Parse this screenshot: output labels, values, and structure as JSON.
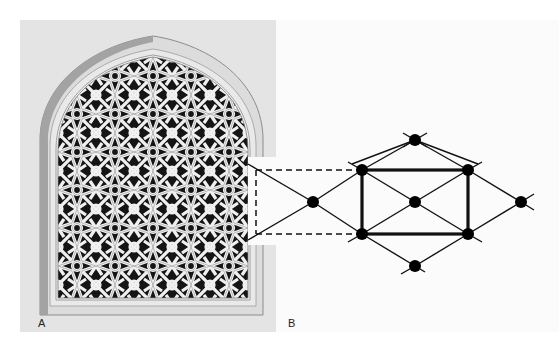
{
  "figure": {
    "panel_a": {
      "label": "A",
      "subject": "arched window with geometric star lattice (jali) screen",
      "colors": {
        "background": "#e4e4e4",
        "frame": "#d9d9d9",
        "frame_shadow": "#9a9a9a",
        "lattice_void": "#111111",
        "lattice_strap": "#f2f2f2"
      }
    },
    "panel_b": {
      "label": "B",
      "subject": "underlying grid of the lattice pattern",
      "nodes": [
        {
          "id": "left",
          "x": 313,
          "y": 202
        },
        {
          "id": "rect-top-left",
          "x": 362,
          "y": 170
        },
        {
          "id": "rect-bottom-left",
          "x": 362,
          "y": 234
        },
        {
          "id": "top",
          "x": 415,
          "y": 140
        },
        {
          "id": "center",
          "x": 415,
          "y": 202
        },
        {
          "id": "bottom",
          "x": 415,
          "y": 266
        },
        {
          "id": "rect-top-right",
          "x": 468,
          "y": 170
        },
        {
          "id": "rect-bottom-right",
          "x": 468,
          "y": 234
        },
        {
          "id": "right",
          "x": 521,
          "y": 202
        }
      ],
      "highlighted_rectangle": {
        "x1": 362,
        "y1": 170,
        "x2": 468,
        "y2": 234
      },
      "callout_box": {
        "x1": 256,
        "y1": 170,
        "x2": 362,
        "y2": 234
      },
      "colors": {
        "line": "#111111",
        "node": "#000000",
        "background": "#fbfbfb"
      }
    }
  }
}
